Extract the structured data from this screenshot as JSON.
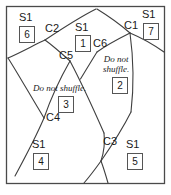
{
  "figure": {
    "kind": "region-partition-diagram",
    "frame": {
      "x": 6,
      "y": 6,
      "width": 159,
      "height": 178,
      "stroke": "#4a4a4a"
    },
    "curve_stroke": "#3a3a3a",
    "text_color": "#1a1a1a"
  },
  "curve_labels": [
    {
      "name": "C1",
      "text": "C1",
      "x": 124,
      "y": 25
    },
    {
      "name": "C2",
      "text": "C2",
      "x": 46,
      "y": 28
    },
    {
      "name": "C3",
      "text": "C3",
      "x": 104,
      "y": 142
    },
    {
      "name": "C4",
      "text": "C4",
      "x": 47,
      "y": 118
    },
    {
      "name": "C5",
      "text": "C5",
      "x": 60,
      "y": 56
    },
    {
      "name": "C6",
      "text": "C6",
      "x": 94,
      "y": 44
    }
  ],
  "regions": [
    {
      "id": "1",
      "s_label": "S1",
      "s_x": 76,
      "s_y": 26,
      "box_x": 75,
      "box_y": 37,
      "note": null
    },
    {
      "id": "2",
      "s_label": null,
      "box_x": 113,
      "box_y": 80,
      "note": {
        "lines": [
          "Do not",
          "shuffle."
        ],
        "x": 105,
        "y": 57,
        "align": "center"
      }
    },
    {
      "id": "3",
      "s_label": null,
      "box_x": 59,
      "box_y": 98,
      "note": {
        "lines": [
          "Do not shuffle."
        ],
        "x": 33,
        "y": 84,
        "align": "left"
      }
    },
    {
      "id": "4",
      "s_label": "S1",
      "s_x": 32,
      "s_y": 143,
      "box_x": 33,
      "box_y": 155,
      "note": null
    },
    {
      "id": "5",
      "s_label": "S1",
      "s_x": 126,
      "s_y": 143,
      "box_x": 127,
      "box_y": 155,
      "note": null
    },
    {
      "id": "6",
      "s_label": "S1",
      "s_x": 19,
      "s_y": 16,
      "box_x": 19,
      "box_y": 28,
      "note": null
    },
    {
      "id": "7",
      "s_label": "S1",
      "s_x": 142,
      "s_y": 13,
      "box_x": 143,
      "box_y": 25,
      "note": null
    }
  ],
  "paths": {
    "c2_to_top": "M 45 40 C 60 30, 78 18, 96 9",
    "c1_to_top": "M 130 33 C 122 26, 110 17, 97 9",
    "c2_to_left": "M 45 40 C 34 45, 22 52, 9 58",
    "c2_to_c5": "M 45 40 C 52 45, 60 52, 70 61",
    "c5_to_c4": "M 70 61 C 62 75, 52 95, 44 118",
    "c4_to_bottomleft": "M 44 118 C 38 132, 28 152, 16 175",
    "c5_to_c3": "M 70 61 C 80 80, 93 108, 104 133",
    "c3_to_bottom": "M 104 133 C 105 142, 104 152, 101 161",
    "c6_to_c5branch": "M 97 52 C 92 60, 86 70, 80 80",
    "c1_to_c6": "M 130 33 C 120 38, 108 44, 97 52",
    "c1_to_right": "M 130 33 C 142 38, 154 45, 164 52",
    "c1_to_c3branch": "M 130 33 C 132 55, 133 85, 131 112",
    "right_lower": "M 131 112 C 122 130, 110 148, 101 161",
    "leftedge_to_c4": "M 9 58 C 18 72, 30 95, 44 118",
    "bottom_fork_left": "M 101 161 C 96 168, 90 176, 84 184",
    "bottom_fork_right": "M 101 161 C 104 169, 106 176, 108 184"
  }
}
